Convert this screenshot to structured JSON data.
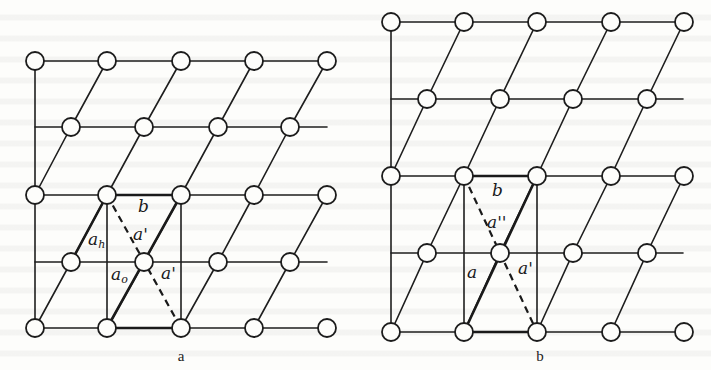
{
  "figure": {
    "background": "#fdfdfb",
    "ink": "#1a1a1a",
    "panels": [
      {
        "id": "a",
        "caption": "a",
        "caption_pos": [
          181,
          361
        ],
        "rows_y": [
          61,
          127,
          195,
          262,
          328
        ],
        "full_row_x": [
          35,
          107,
          181,
          254,
          327
        ],
        "offset_row_x": [
          71,
          144,
          218,
          290
        ],
        "left_edge_x": 35,
        "offset_row_line_end_x": 327,
        "unit_cell": {
          "top_left": [
            107,
            195
          ],
          "top_right": [
            181,
            195
          ],
          "bottom_left": [
            107,
            328
          ],
          "bottom_right": [
            181,
            328
          ],
          "center": [
            144,
            262
          ]
        },
        "bold_vector_h": {
          "from": [
            107,
            195
          ],
          "to": [
            71,
            262
          ]
        },
        "labels": [
          {
            "text": "b",
            "sub": "",
            "x": 138,
            "y": 212
          },
          {
            "text": "a'",
            "sub": "",
            "x": 133,
            "y": 240
          },
          {
            "text": "a",
            "sub": "h",
            "x": 88,
            "y": 245
          },
          {
            "text": "a",
            "sub": "o",
            "x": 111,
            "y": 280
          },
          {
            "text": "a'",
            "sub": "",
            "x": 161,
            "y": 279
          }
        ]
      },
      {
        "id": "b",
        "caption": "b",
        "caption_pos": [
          540,
          361
        ],
        "rows_y": [
          22,
          99,
          176,
          253,
          332
        ],
        "full_row_x": [
          391,
          464,
          537,
          611,
          684
        ],
        "offset_row_x": [
          427,
          500,
          573,
          647
        ],
        "left_edge_x": 391,
        "offset_row_line_end_x": 683,
        "unit_cell": {
          "top_left": [
            464,
            176
          ],
          "top_right": [
            537,
            176
          ],
          "bottom_left": [
            464,
            332
          ],
          "bottom_right": [
            537,
            332
          ],
          "center": [
            501,
            253
          ]
        },
        "bold_vector_h": null,
        "labels": [
          {
            "text": "b",
            "sub": "",
            "x": 492,
            "y": 196
          },
          {
            "text": "a''",
            "sub": "",
            "x": 487,
            "y": 228
          },
          {
            "text": "a",
            "sub": "",
            "x": 467,
            "y": 278
          },
          {
            "text": "a'",
            "sub": "",
            "x": 518,
            "y": 274
          }
        ]
      }
    ]
  }
}
